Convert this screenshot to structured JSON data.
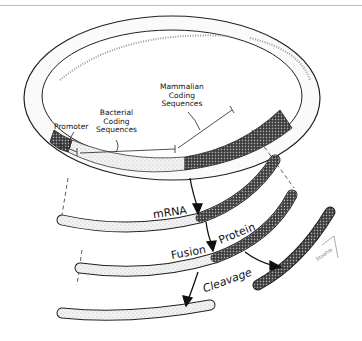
{
  "figure": {
    "labels": {
      "promoter": "Promoter",
      "bacterial": "Bacterial Coding Sequences",
      "bacterial_lines": [
        "Bacterial",
        "Coding",
        "Sequences"
      ],
      "mammalian_lines": [
        "Mammalian",
        "Coding",
        "Sequences"
      ],
      "mrna": "mRNA",
      "fusion": "Fusion",
      "protein": "Protein",
      "cleavage": "Cleavage",
      "signature": "Staehle"
    }
  }
}
